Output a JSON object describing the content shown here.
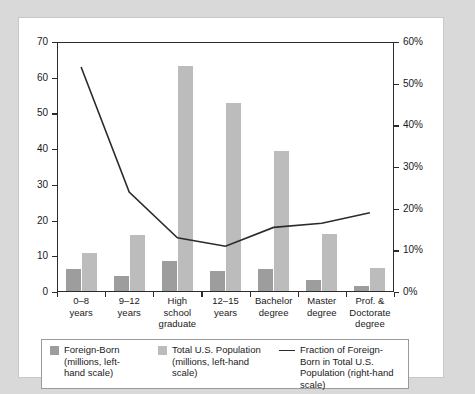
{
  "chart_data": {
    "type": "bar",
    "title": "",
    "subtitle": "",
    "xlabel": "",
    "ylabel": "",
    "y2label": "",
    "categories": [
      "0–8 years",
      "9–12 years",
      "High school graduate",
      "12–15 years",
      "Bachelor degree",
      "Master degree",
      "Prof. & Doctorate degree"
    ],
    "category_lines": [
      [
        "0–8",
        "years"
      ],
      [
        "9–12",
        "years"
      ],
      [
        "High school",
        "graduate"
      ],
      [
        "12–15",
        "years"
      ],
      [
        "Bachelor",
        "degree"
      ],
      [
        "Master",
        "degree"
      ],
      [
        "Prof. &",
        "Doctorate",
        "degree"
      ]
    ],
    "series": [
      {
        "name": "Foreign-Born (millions, left-hand scale)",
        "type": "bar",
        "axis": "left",
        "color": "#9d9d9d",
        "values": [
          6.0,
          4.1,
          8.3,
          5.5,
          6.0,
          2.9,
          1.3
        ]
      },
      {
        "name": "Total U.S. Population (millions, left-hand scale)",
        "type": "bar",
        "axis": "left",
        "color": "#bcbcbc",
        "values": [
          10.7,
          15.5,
          63.0,
          52.5,
          39.0,
          16.0,
          6.5
        ]
      },
      {
        "name": "Fraction of Foreign-Born in Total U.S. Population (right-hand scale)",
        "type": "line",
        "axis": "right",
        "color": "#2b2b2b",
        "values": [
          54.0,
          24.0,
          13.0,
          11.0,
          15.5,
          16.5,
          19.0
        ]
      }
    ],
    "ylim": [
      0,
      70
    ],
    "yticks": [
      0,
      10,
      20,
      30,
      40,
      50,
      60,
      70
    ],
    "ytick_labels": [
      "0",
      "10",
      "20",
      "30",
      "40",
      "50",
      "60",
      "70"
    ],
    "y2lim": [
      0,
      60
    ],
    "y2ticks": [
      0,
      10,
      20,
      30,
      40,
      50,
      60
    ],
    "y2tick_labels": [
      "0%",
      "10%",
      "20%",
      "30%",
      "40%",
      "50%",
      "60%"
    ],
    "grid": false,
    "legend_position": "bottom",
    "legend": [
      {
        "marker": "bar-swatch-dark",
        "lines": [
          "Foreign-Born",
          "(millions, left-",
          "hand scale)"
        ]
      },
      {
        "marker": "bar-swatch-light",
        "lines": [
          "Total U.S. Population",
          "(millions, left-hand",
          "scale)"
        ]
      },
      {
        "marker": "line-sample",
        "lines": [
          "Fraction of Foreign-",
          "Born in Total U.S.",
          "Population (right-hand",
          "scale)"
        ]
      }
    ],
    "colors": {
      "background": "#d9d9d9",
      "panel": "#ffffff",
      "axis": "#2b2b2b",
      "series_foreign_born": "#9d9d9d",
      "series_total_population": "#bcbcbc",
      "series_fraction_line": "#2b2b2b"
    }
  }
}
